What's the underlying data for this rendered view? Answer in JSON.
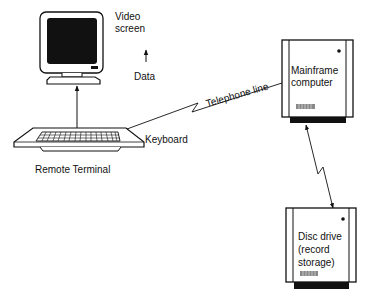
{
  "diagram": {
    "type": "system-architecture",
    "nodes": {
      "monitor": {
        "label_line1": "Video",
        "label_line2": "screen"
      },
      "keyboard": {
        "label": "Keyboard"
      },
      "terminal": {
        "label": "Remote Terminal"
      },
      "mainframe": {
        "label_line1": "Mainframe",
        "label_line2": "computer"
      },
      "disc": {
        "label_line1": "Disc drive",
        "label_line2": "(record",
        "label_line3": "storage)"
      }
    },
    "annotations": {
      "data": "Data",
      "telephone": "Telephone line"
    },
    "edges": [
      {
        "from": "keyboard",
        "to": "monitor",
        "style": "arrow"
      },
      {
        "from": "keyboard",
        "to": "mainframe",
        "label": "Telephone line",
        "style": "zigzag"
      },
      {
        "from": "mainframe",
        "to": "disc",
        "style": "zigzag-double-arrow"
      }
    ],
    "colors": {
      "ink": "#111111",
      "background": "#ffffff"
    }
  }
}
